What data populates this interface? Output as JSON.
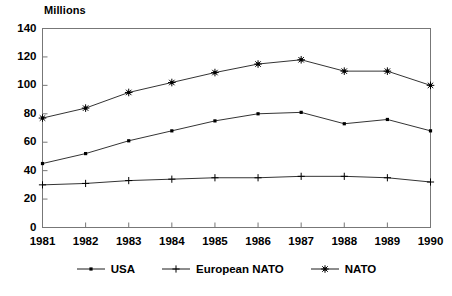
{
  "chart_data": {
    "type": "line",
    "title": "Millions",
    "xlabel": "",
    "ylabel": "",
    "ylim": [
      0,
      140
    ],
    "ytick_step": 20,
    "yticks": [
      "0",
      "20",
      "40",
      "60",
      "80",
      "100",
      "120",
      "140"
    ],
    "grid": false,
    "legend_position": "bottom",
    "categories": [
      "1981",
      "1982",
      "1983",
      "1984",
      "1985",
      "1986",
      "1987",
      "1988",
      "1989",
      "1990"
    ],
    "series": [
      {
        "name": "USA",
        "marker": "dot",
        "color": "#000000",
        "values": [
          45,
          52,
          61,
          68,
          75,
          80,
          81,
          73,
          76,
          68
        ]
      },
      {
        "name": "European NATO",
        "marker": "plus",
        "color": "#000000",
        "values": [
          30,
          31,
          33,
          34,
          35,
          35,
          36,
          36,
          35,
          32
        ]
      },
      {
        "name": "NATO",
        "marker": "star",
        "color": "#000000",
        "values": [
          77,
          84,
          95,
          102,
          109,
          115,
          118,
          110,
          110,
          100
        ]
      }
    ]
  },
  "legend": {
    "entries": [
      {
        "label": "USA"
      },
      {
        "label": "European NATO"
      },
      {
        "label": "NATO"
      }
    ]
  }
}
